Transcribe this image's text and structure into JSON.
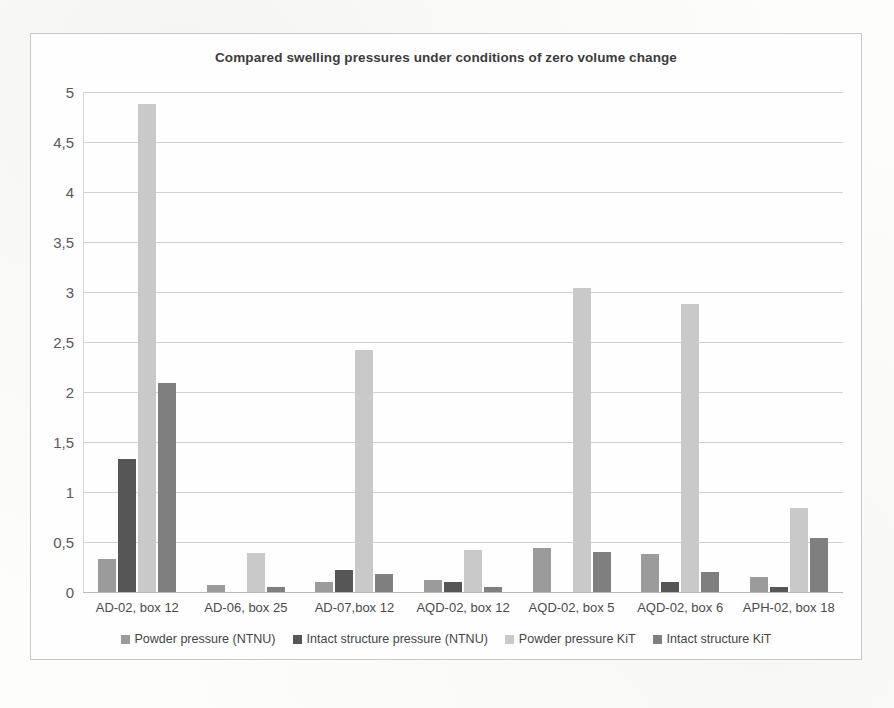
{
  "chart_data": {
    "type": "bar",
    "title": "Compared swelling pressures under conditions of zero volume change",
    "xlabel": "",
    "ylabel": "",
    "ylim": [
      0,
      5
    ],
    "ytick_labels": [
      "5",
      "4,5",
      "4",
      "3,5",
      "3",
      "2,5",
      "2",
      "1,5",
      "1",
      "0,5",
      "0"
    ],
    "ytick_values": [
      5,
      4.5,
      4,
      3.5,
      3,
      2.5,
      2,
      1.5,
      1,
      0.5,
      0
    ],
    "grid": true,
    "legend_position": "bottom",
    "decimal_separator": ",",
    "categories": [
      "AD-02, box 12",
      "AD-06, box 25",
      "AD-07,box 12",
      "AQD-02, box 12",
      "AQD-02, box 5",
      "AQD-02, box 6",
      "APH-02, box 18"
    ],
    "series": [
      {
        "name": "Powder pressure (NTNU)",
        "color": "#9b9b9b",
        "values": [
          0.33,
          0.07,
          0.1,
          0.12,
          0.44,
          0.38,
          0.15
        ]
      },
      {
        "name": "Intact structure pressure (NTNU)",
        "color": "#565656",
        "values": [
          1.33,
          0,
          0.22,
          0.1,
          0,
          0.1,
          0.05
        ]
      },
      {
        "name": "Powder pressure KiT",
        "color": "#c9c9c9",
        "values": [
          4.88,
          0.39,
          2.42,
          0.42,
          3.04,
          2.88,
          0.84
        ]
      },
      {
        "name": "Intact structure KiT",
        "color": "#7f7f7f",
        "values": [
          2.09,
          0.055,
          0.18,
          0.055,
          0.4,
          0.2,
          0.54
        ]
      }
    ]
  }
}
